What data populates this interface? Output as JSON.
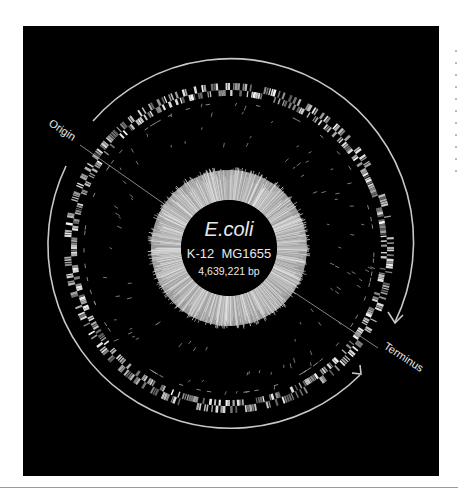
{
  "genome": {
    "organism": "E.coli",
    "strain": "K-12  MG1655",
    "size": "4,639,221 bp"
  },
  "labels": {
    "origin": "Origin",
    "terminus": "Terminus"
  },
  "colors": {
    "background": "#000000",
    "track": "#d8d8d8",
    "arrow": "#c8c8c8",
    "text": "#e8e8e8"
  },
  "tracks": [
    {
      "name": "gene-annotation-ring",
      "description": "forward/reverse strand genes"
    },
    {
      "name": "feature-ring",
      "description": "sparse features"
    },
    {
      "name": "density-ring",
      "description": "dense radial histogram"
    }
  ],
  "replichores": [
    {
      "name": "clockwise replichore",
      "direction": "origin to terminus clockwise"
    },
    {
      "name": "counter-clockwise replichore",
      "direction": "origin to terminus counter-clockwise"
    }
  ]
}
